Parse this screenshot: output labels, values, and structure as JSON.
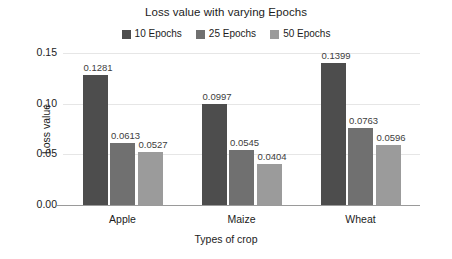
{
  "chart_data": {
    "type": "bar",
    "title": "Loss value with varying Epochs",
    "xlabel": "Types of crop",
    "ylabel": "Loss value",
    "categories": [
      "Apple",
      "Maize",
      "Wheat"
    ],
    "series": [
      {
        "name": "10 Epochs",
        "color": "#4d4d4d",
        "values": [
          0.1281,
          0.0997,
          0.1399
        ],
        "labels": [
          "0.1281",
          "0.0997",
          "0.1399"
        ]
      },
      {
        "name": "25 Epochs",
        "color": "#707070",
        "values": [
          0.0613,
          0.0545,
          0.0763
        ],
        "labels": [
          "0.0613",
          "0.0545",
          "0.0763"
        ]
      },
      {
        "name": "50 Epochs",
        "color": "#9b9b9b",
        "values": [
          0.0527,
          0.0404,
          0.0596
        ],
        "labels": [
          "0.0527",
          "0.0404",
          "0.0596"
        ]
      }
    ],
    "ylim": [
      0.0,
      0.15
    ],
    "yticks": [
      "0.00",
      "0.05",
      "0.10",
      "0.15"
    ],
    "ytick_values": [
      0.0,
      0.05,
      0.1,
      0.15
    ],
    "grid": true,
    "legend_position": "top-center"
  }
}
